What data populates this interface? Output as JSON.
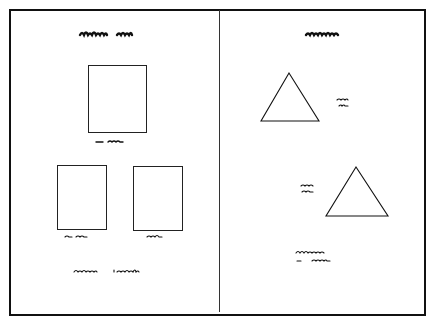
{
  "left_panel": {
    "title": "illegible handwritten heading",
    "shapes": [
      {
        "type": "rectangle",
        "label": "illegible label"
      },
      {
        "type": "rectangle",
        "label": "illegible label"
      },
      {
        "type": "rectangle",
        "label": "illegible label"
      }
    ],
    "caption": "illegible handwritten caption"
  },
  "right_panel": {
    "title": "illegible handwritten heading",
    "shapes": [
      {
        "type": "triangle",
        "label": "illegible two-line label"
      },
      {
        "type": "triangle",
        "label": "illegible two-line label"
      }
    ],
    "caption": "illegible two-line handwritten caption"
  },
  "colors": {
    "line": "#111111",
    "background": "#ffffff"
  }
}
